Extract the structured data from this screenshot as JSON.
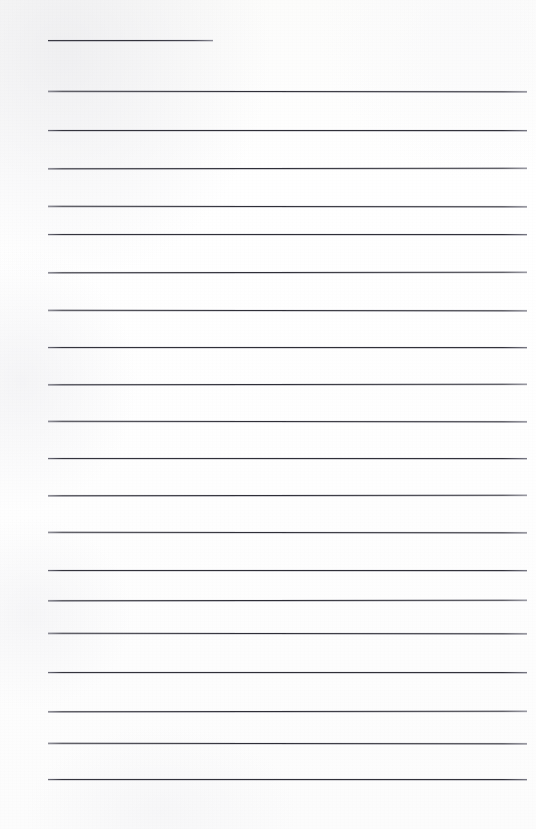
{
  "document": {
    "kind": "scanned-lined-paper",
    "title": "Blank ruled notebook page",
    "page_width": 536,
    "page_height": 829,
    "text_content": "",
    "has_handwriting": false,
    "has_printed_text": false,
    "colors": {
      "paper": "#fdfdfc",
      "rule": "#33333c",
      "rule_soft_edge": "#7a7a86"
    }
  },
  "ruling": {
    "left_margin_x": 48,
    "right_margin_x": 527,
    "line_spacing_px": 38.2,
    "stroke_width_px": 1,
    "full_line_count": 19,
    "short_line_count": 1,
    "lines": [
      {
        "name": "title-rule",
        "y": 40,
        "x1": 48,
        "x2": 213,
        "style": "short"
      },
      {
        "name": "body-rule-1",
        "y": 91,
        "x1": 48,
        "x2": 527,
        "style": "full"
      },
      {
        "name": "body-rule-2",
        "y": 130,
        "x1": 48,
        "x2": 527,
        "style": "full"
      },
      {
        "name": "body-rule-3",
        "y": 168,
        "x1": 48,
        "x2": 527,
        "style": "full"
      },
      {
        "name": "body-rule-4",
        "y": 206,
        "x1": 48,
        "x2": 527,
        "style": "full"
      },
      {
        "name": "body-rule-5",
        "y": 234,
        "x1": 48,
        "x2": 527,
        "style": "full"
      },
      {
        "name": "body-rule-6",
        "y": 272,
        "x1": 48,
        "x2": 527,
        "style": "full"
      },
      {
        "name": "body-rule-7",
        "y": 310,
        "x1": 48,
        "x2": 527,
        "style": "full"
      },
      {
        "name": "body-rule-8",
        "y": 347,
        "x1": 48,
        "x2": 527,
        "style": "full"
      },
      {
        "name": "body-rule-9",
        "y": 384,
        "x1": 48,
        "x2": 527,
        "style": "full"
      },
      {
        "name": "body-rule-10",
        "y": 421,
        "x1": 48,
        "x2": 527,
        "style": "full"
      },
      {
        "name": "body-rule-11",
        "y": 458,
        "x1": 48,
        "x2": 527,
        "style": "full"
      },
      {
        "name": "body-rule-12",
        "y": 495,
        "x1": 48,
        "x2": 527,
        "style": "full"
      },
      {
        "name": "body-rule-13",
        "y": 532,
        "x1": 48,
        "x2": 527,
        "style": "full"
      },
      {
        "name": "body-rule-14",
        "y": 570,
        "x1": 48,
        "x2": 527,
        "style": "full"
      },
      {
        "name": "body-rule-15",
        "y": 600,
        "x1": 48,
        "x2": 527,
        "style": "full"
      },
      {
        "name": "body-rule-16",
        "y": 633,
        "x1": 48,
        "x2": 527,
        "style": "full"
      },
      {
        "name": "body-rule-17",
        "y": 672,
        "x1": 48,
        "x2": 527,
        "style": "full"
      },
      {
        "name": "body-rule-18",
        "y": 711,
        "x1": 48,
        "x2": 527,
        "style": "full"
      },
      {
        "name": "body-rule-19",
        "y": 743,
        "x1": 48,
        "x2": 527,
        "style": "full"
      },
      {
        "name": "body-rule-20",
        "y": 779,
        "x1": 48,
        "x2": 527,
        "style": "full"
      }
    ]
  }
}
